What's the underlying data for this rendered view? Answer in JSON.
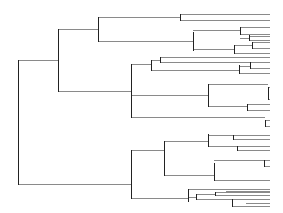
{
  "diagram": {
    "type": "dendrogram",
    "orientation": "left-to-right",
    "leaf_edge_x": 270,
    "colors": {
      "background": "#ffffff",
      "vertical": "#222222",
      "horizontal": "#8a8a8a"
    },
    "verticals": [
      [
        18,
        60,
        184
      ],
      [
        58,
        29,
        91
      ],
      [
        98,
        17,
        41
      ],
      [
        180,
        14,
        20
      ],
      [
        193,
        32,
        50
      ],
      [
        240,
        27,
        34
      ],
      [
        249,
        35,
        40
      ],
      [
        234,
        45,
        53
      ],
      [
        252,
        42,
        48
      ],
      [
        131,
        64,
        117
      ],
      [
        151,
        60,
        70
      ],
      [
        160,
        57,
        62
      ],
      [
        239,
        65,
        73
      ],
      [
        250,
        62,
        68
      ],
      [
        208,
        84,
        106
      ],
      [
        268,
        87,
        99
      ],
      [
        247,
        104,
        110
      ],
      [
        265,
        120,
        126
      ],
      [
        131,
        150,
        198
      ],
      [
        164,
        141,
        175
      ],
      [
        208,
        134,
        146
      ],
      [
        233,
        135,
        139
      ],
      [
        237,
        146,
        150
      ],
      [
        214,
        163,
        180
      ],
      [
        264,
        160,
        166
      ],
      [
        188,
        189,
        201
      ],
      [
        196,
        194,
        199
      ],
      [
        215,
        192,
        195
      ],
      [
        232,
        199,
        206
      ]
    ],
    "horizontals": [
      [
        18,
        58,
        60
      ],
      [
        18,
        131,
        184
      ],
      [
        58,
        98,
        29
      ],
      [
        58,
        131,
        91
      ],
      [
        98,
        180,
        17
      ],
      [
        98,
        193,
        41
      ],
      [
        180,
        270,
        14
      ],
      [
        180,
        270,
        20
      ],
      [
        193,
        240,
        30
      ],
      [
        193,
        234,
        49
      ],
      [
        240,
        270,
        27
      ],
      [
        240,
        270,
        34
      ],
      [
        240,
        249,
        38
      ],
      [
        249,
        270,
        36
      ],
      [
        249,
        270,
        40
      ],
      [
        234,
        252,
        45
      ],
      [
        234,
        270,
        53
      ],
      [
        252,
        270,
        42
      ],
      [
        252,
        270,
        48
      ],
      [
        131,
        151,
        64
      ],
      [
        131,
        208,
        95
      ],
      [
        151,
        160,
        60
      ],
      [
        151,
        239,
        70
      ],
      [
        160,
        270,
        57
      ],
      [
        160,
        270,
        62
      ],
      [
        239,
        250,
        66
      ],
      [
        239,
        270,
        73
      ],
      [
        250,
        270,
        62
      ],
      [
        250,
        270,
        68
      ],
      [
        208,
        268,
        84
      ],
      [
        208,
        247,
        106
      ],
      [
        268,
        270,
        87
      ],
      [
        268,
        270,
        99
      ],
      [
        247,
        270,
        104
      ],
      [
        247,
        270,
        110
      ],
      [
        131,
        265,
        117
      ],
      [
        265,
        270,
        120
      ],
      [
        265,
        270,
        126
      ],
      [
        131,
        164,
        150
      ],
      [
        131,
        188,
        198
      ],
      [
        164,
        208,
        141
      ],
      [
        164,
        214,
        175
      ],
      [
        208,
        233,
        135
      ],
      [
        208,
        237,
        146
      ],
      [
        233,
        270,
        135
      ],
      [
        233,
        270,
        139
      ],
      [
        237,
        270,
        146
      ],
      [
        237,
        270,
        150
      ],
      [
        214,
        264,
        160
      ],
      [
        214,
        270,
        180
      ],
      [
        264,
        270,
        160
      ],
      [
        264,
        270,
        166
      ],
      [
        188,
        270,
        189
      ],
      [
        188,
        196,
        197
      ],
      [
        196,
        215,
        194
      ],
      [
        196,
        232,
        199
      ],
      [
        215,
        270,
        192
      ],
      [
        215,
        270,
        195
      ],
      [
        232,
        270,
        199
      ],
      [
        232,
        270,
        206
      ],
      [
        226,
        270,
        191
      ],
      [
        246,
        270,
        203
      ]
    ]
  }
}
